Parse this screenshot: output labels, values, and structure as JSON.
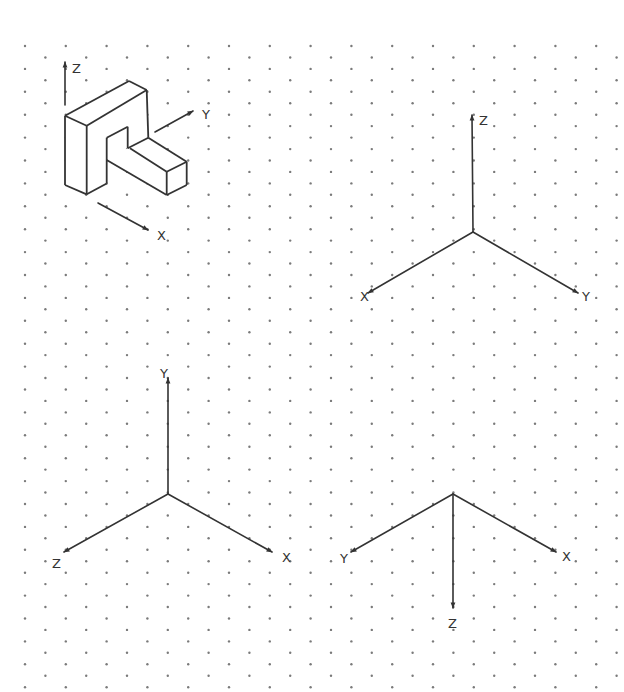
{
  "page": {
    "width": 624,
    "height": 692,
    "background": "#ffffff",
    "line_color": "#333333",
    "dot_color": "#7a7a7a"
  },
  "grid": {
    "type": "isometric-dot-grid",
    "first_row_y": 46,
    "row_step": 11.45,
    "rows": 57,
    "col_step": 40.8,
    "even_row_x0": 25,
    "odd_row_x0": 45.4,
    "dot_radius": 1.2
  },
  "object": {
    "name": "isometric-bracket",
    "faces": [
      {
        "name": "top-face",
        "points": [
          [
            65,
            115.7
          ],
          [
            129,
            81
          ],
          [
            146.7,
            90
          ],
          [
            86.7,
            125.7
          ]
        ]
      },
      {
        "name": "front-left-face",
        "points": [
          [
            65,
            115.7
          ],
          [
            86.7,
            125.7
          ],
          [
            86.7,
            194.3
          ],
          [
            65,
            185
          ]
        ]
      },
      {
        "name": "front-face-upright",
        "points": [
          [
            86.7,
            125.7
          ],
          [
            146.7,
            90
          ],
          [
            148.3,
            137.7
          ],
          [
            130,
            148.3
          ],
          [
            127.7,
            148.3
          ],
          [
            127.7,
            126.7
          ],
          [
            106.7,
            137.7
          ],
          [
            106.7,
            183
          ],
          [
            86.7,
            194.3
          ]
        ]
      },
      {
        "name": "arm-top-face",
        "points": [
          [
            130,
            148.3
          ],
          [
            148.3,
            137.7
          ],
          [
            186.7,
            161.7
          ],
          [
            166.7,
            171.7
          ]
        ]
      },
      {
        "name": "arm-front-face",
        "points": [
          [
            106.7,
            160
          ],
          [
            127.7,
            148.3
          ],
          [
            130,
            148.3
          ],
          [
            166.7,
            171.7
          ],
          [
            166.7,
            195
          ],
          [
            106.7,
            160
          ]
        ]
      },
      {
        "name": "arm-end-face",
        "points": [
          [
            166.7,
            171.7
          ],
          [
            186.7,
            161.7
          ],
          [
            186.7,
            185
          ],
          [
            166.7,
            195
          ]
        ]
      }
    ],
    "edges": [
      [
        [
          65,
          115.7
        ],
        [
          129,
          81
        ]
      ],
      [
        [
          129,
          81
        ],
        [
          146.7,
          90
        ]
      ],
      [
        [
          146.7,
          90
        ],
        [
          86.7,
          125.7
        ]
      ],
      [
        [
          86.7,
          125.7
        ],
        [
          65,
          115.7
        ]
      ],
      [
        [
          65,
          115.7
        ],
        [
          65,
          185
        ]
      ],
      [
        [
          65,
          185
        ],
        [
          86.7,
          194.3
        ]
      ],
      [
        [
          86.7,
          125.7
        ],
        [
          86.7,
          194.3
        ]
      ],
      [
        [
          86.7,
          194.3
        ],
        [
          106.7,
          183.5
        ]
      ],
      [
        [
          106.7,
          137.7
        ],
        [
          106.7,
          183.5
        ]
      ],
      [
        [
          106.7,
          137.7
        ],
        [
          127.7,
          126.7
        ]
      ],
      [
        [
          127.7,
          126.7
        ],
        [
          127.7,
          148.3
        ]
      ],
      [
        [
          146.7,
          90
        ],
        [
          148.3,
          137.7
        ]
      ],
      [
        [
          127.7,
          148.3
        ],
        [
          148.3,
          137.7
        ]
      ],
      [
        [
          148.3,
          137.7
        ],
        [
          186.7,
          161.7
        ]
      ],
      [
        [
          130,
          148.3
        ],
        [
          166.7,
          171.7
        ]
      ],
      [
        [
          166.7,
          171.7
        ],
        [
          186.7,
          161.7
        ]
      ],
      [
        [
          166.7,
          171.7
        ],
        [
          166.7,
          195
        ]
      ],
      [
        [
          186.7,
          161.7
        ],
        [
          186.7,
          185
        ]
      ],
      [
        [
          166.7,
          195
        ],
        [
          186.7,
          185
        ]
      ],
      [
        [
          106.7,
          160
        ],
        [
          166.7,
          195
        ]
      ]
    ],
    "arrows": [
      {
        "name": "z-arrow",
        "from": [
          65,
          105
        ],
        "to": [
          65,
          62
        ],
        "label": "Z",
        "label_pos": [
          72,
          73
        ]
      },
      {
        "name": "y-arrow",
        "from": [
          155,
          132
        ],
        "to": [
          193,
          111
        ],
        "label": "Y",
        "label_pos": [
          202,
          119
        ]
      },
      {
        "name": "x-arrow",
        "from": [
          98,
          203
        ],
        "to": [
          148,
          230
        ],
        "label": "X",
        "label_pos": [
          157,
          240
        ]
      }
    ]
  },
  "axis_sets": [
    {
      "name": "axes-top-right",
      "origin": [
        473,
        232
      ],
      "axes": [
        {
          "label": "Z",
          "tip": [
            472,
            115
          ],
          "label_pos": [
            479,
            125
          ]
        },
        {
          "label": "X",
          "tip": [
            368,
            293
          ],
          "label_pos": [
            360,
            301
          ]
        },
        {
          "label": "Y",
          "tip": [
            578,
            293
          ],
          "label_pos": [
            582,
            301
          ]
        }
      ]
    },
    {
      "name": "axes-bottom-left",
      "origin": [
        168,
        494
      ],
      "axes": [
        {
          "label": "Y",
          "tip": [
            168,
            378
          ],
          "label_pos": [
            160,
            378
          ]
        },
        {
          "label": "Z",
          "tip": [
            64,
            552
          ],
          "label_pos": [
            52,
            568
          ]
        },
        {
          "label": "X",
          "tip": [
            272,
            552
          ],
          "label_pos": [
            282,
            562
          ]
        }
      ]
    },
    {
      "name": "axes-bottom-right",
      "origin": [
        453,
        494
      ],
      "axes": [
        {
          "label": "Y",
          "tip": [
            351,
            552
          ],
          "label_pos": [
            340,
            563
          ]
        },
        {
          "label": "X",
          "tip": [
            556,
            552
          ],
          "label_pos": [
            562,
            561
          ]
        },
        {
          "label": "Z",
          "tip": [
            453,
            608
          ],
          "label_pos": [
            448,
            628
          ]
        }
      ]
    }
  ]
}
